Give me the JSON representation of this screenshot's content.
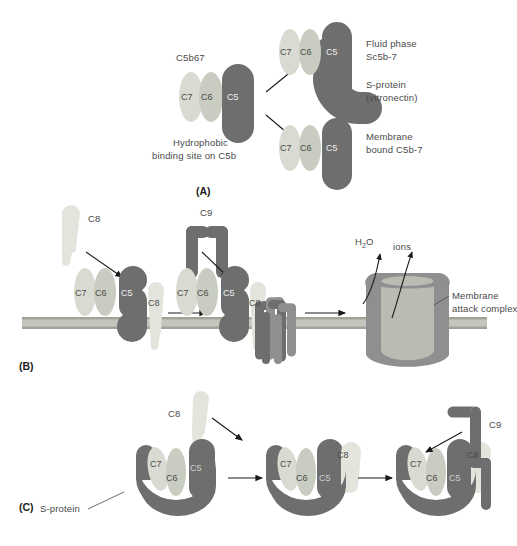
{
  "figure": {
    "panels": [
      {
        "id": "(A)",
        "name": "panel-a"
      },
      {
        "id": "(B)",
        "name": "panel-b"
      },
      {
        "id": "(C)",
        "name": "panel-c"
      }
    ]
  },
  "panel_a": {
    "label": "(A)",
    "complex_title": "C5b67",
    "complex_subunits": [
      "C7",
      "C6",
      "C5"
    ],
    "hydrophobic_note_line1": "Hydrophobic",
    "hydrophobic_note_line2": "binding site on C5b",
    "fluid_subunits": [
      "C7",
      "C6",
      "C5"
    ],
    "fluid_label_line1": "Fluid phase",
    "fluid_label_line2": "Sc5b-7",
    "sprotein_label_line1": "S-protein",
    "sprotein_label_line2": "(vitronectin)",
    "membrane_subunits": [
      "C7",
      "C6",
      "C5"
    ],
    "membrane_label_line1": "Membrane",
    "membrane_label_line2": "bound C5b-7"
  },
  "panel_b": {
    "label": "(B)",
    "c8_free_label": "C8",
    "c9_free_label": "C9",
    "complex1_subunits": [
      "C7",
      "C6",
      "C5"
    ],
    "complex1_c8": "C8",
    "complex2_subunits": [
      "C7",
      "C6",
      "C5"
    ],
    "complex2_c8": "C8",
    "water_label": "H",
    "water_sub": "2",
    "water_label2": "O",
    "ions_label": "ions",
    "mac_label_line1": "Membrane",
    "mac_label_line2": "attack complex"
  },
  "panel_c": {
    "label": "(C)",
    "sprotein_label": "S-protein",
    "c8_free_label": "C8",
    "c9_free_label": "C9",
    "complex1_subunits": [
      "C7",
      "C6",
      "C5"
    ],
    "complex2_subunits": [
      "C7",
      "C6",
      "C5"
    ],
    "complex2_c8": "C8",
    "complex3_subunits": [
      "C7",
      "C6",
      "C5"
    ],
    "complex3_c8": "C8"
  },
  "colors": {
    "dark_protein": "#6e6e6e",
    "mid_protein": "#8f8f8f",
    "pale_protein": "#d9dbd2",
    "pale_protein2": "#c9ccc0",
    "membrane": "#c3c6bc",
    "membrane_edge": "#9fa398",
    "arrow": "#1a1a1a",
    "text": "#4a4a4a"
  }
}
